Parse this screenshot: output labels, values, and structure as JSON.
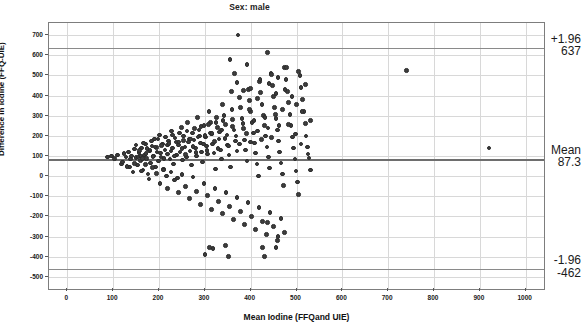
{
  "chart_data": {
    "type": "scatter",
    "title": "Sex: male",
    "xlabel": "Mean Iodine (FFQand UIE)",
    "ylabel": "Difference in iodine (FFQ-UIE)",
    "xlim": [
      -40,
      1040
    ],
    "ylim": [
      -560,
      760
    ],
    "xticks": [
      0,
      100,
      200,
      300,
      400,
      500,
      600,
      700,
      800,
      900,
      1000
    ],
    "yticks": [
      700,
      600,
      500,
      400,
      300,
      200,
      100,
      0,
      -100,
      -200,
      -300,
      -400,
      -500
    ],
    "grid": true,
    "legend": "none",
    "reference_lines": [
      {
        "name": "upper-loa",
        "value": 637,
        "label_top": "+1.96",
        "label_bottom": "637"
      },
      {
        "name": "mean-bias",
        "value": 87.3,
        "label_top": "Mean",
        "label_bottom": "87.3"
      },
      {
        "name": "lower-loa",
        "value": -462,
        "label_top": "-1.96",
        "label_bottom": "-462"
      }
    ],
    "points": [
      [
        88,
        95
      ],
      [
        96,
        100
      ],
      [
        103,
        88
      ],
      [
        110,
        105
      ],
      [
        118,
        60
      ],
      [
        124,
        112
      ],
      [
        128,
        95
      ],
      [
        133,
        120
      ],
      [
        136,
        45
      ],
      [
        140,
        100
      ],
      [
        143,
        20
      ],
      [
        147,
        135
      ],
      [
        150,
        92
      ],
      [
        153,
        55
      ],
      [
        156,
        118
      ],
      [
        159,
        78
      ],
      [
        162,
        140
      ],
      [
        165,
        30
      ],
      [
        168,
        105
      ],
      [
        170,
        160
      ],
      [
        173,
        88
      ],
      [
        176,
        10
      ],
      [
        179,
        125
      ],
      [
        182,
        65
      ],
      [
        185,
        150
      ],
      [
        188,
        100
      ],
      [
        190,
        185
      ],
      [
        193,
        45
      ],
      [
        196,
        120
      ],
      [
        199,
        75
      ],
      [
        201,
        205
      ],
      [
        204,
        95
      ],
      [
        207,
        160
      ],
      [
        210,
        35
      ],
      [
        213,
        130
      ],
      [
        216,
        0
      ],
      [
        218,
        110
      ],
      [
        221,
        175
      ],
      [
        224,
        85
      ],
      [
        227,
        225
      ],
      [
        229,
        140
      ],
      [
        232,
        60
      ],
      [
        235,
        190
      ],
      [
        238,
        105
      ],
      [
        240,
        -10
      ],
      [
        243,
        155
      ],
      [
        246,
        120
      ],
      [
        249,
        240
      ],
      [
        251,
        80
      ],
      [
        254,
        200
      ],
      [
        257,
        145
      ],
      [
        260,
        95
      ],
      [
        262,
        265
      ],
      [
        265,
        170
      ],
      [
        268,
        125
      ],
      [
        271,
        55
      ],
      [
        273,
        215
      ],
      [
        276,
        180
      ],
      [
        279,
        140
      ],
      [
        282,
        100
      ],
      [
        284,
        290
      ],
      [
        287,
        230
      ],
      [
        290,
        165
      ],
      [
        293,
        120
      ],
      [
        295,
        70
      ],
      [
        298,
        250
      ],
      [
        301,
        195
      ],
      [
        304,
        150
      ],
      [
        306,
        110
      ],
      [
        309,
        320
      ],
      [
        312,
        265
      ],
      [
        315,
        210
      ],
      [
        317,
        160
      ],
      [
        320,
        115
      ],
      [
        323,
        35
      ],
      [
        326,
        290
      ],
      [
        328,
        240
      ],
      [
        331,
        185
      ],
      [
        334,
        130
      ],
      [
        337,
        85
      ],
      [
        339,
        355
      ],
      [
        342,
        300
      ],
      [
        345,
        255
      ],
      [
        348,
        205
      ],
      [
        350,
        155
      ],
      [
        353,
        105
      ],
      [
        356,
        45
      ],
      [
        359,
        330
      ],
      [
        361,
        280
      ],
      [
        364,
        230
      ],
      [
        367,
        175
      ],
      [
        370,
        125
      ],
      [
        372,
        700
      ],
      [
        375,
        390
      ],
      [
        378,
        340
      ],
      [
        381,
        285
      ],
      [
        384,
        235
      ],
      [
        386,
        180
      ],
      [
        389,
        130
      ],
      [
        392,
        75
      ],
      [
        395,
        430
      ],
      [
        397,
        375
      ],
      [
        400,
        320
      ],
      [
        403,
        265
      ],
      [
        406,
        215
      ],
      [
        408,
        165
      ],
      [
        411,
        115
      ],
      [
        414,
        60
      ],
      [
        417,
        0
      ],
      [
        419,
        470
      ],
      [
        422,
        415
      ],
      [
        425,
        355
      ],
      [
        428,
        300
      ],
      [
        430,
        250
      ],
      [
        433,
        200
      ],
      [
        436,
        145
      ],
      [
        439,
        95
      ],
      [
        441,
        40
      ],
      [
        444,
        510
      ],
      [
        447,
        450
      ],
      [
        450,
        395
      ],
      [
        452,
        340
      ],
      [
        455,
        285
      ],
      [
        458,
        230
      ],
      [
        461,
        175
      ],
      [
        463,
        120
      ],
      [
        466,
        65
      ],
      [
        469,
        10
      ],
      [
        472,
        -45
      ],
      [
        474,
        540
      ],
      [
        477,
        480
      ],
      [
        480,
        420
      ],
      [
        483,
        365
      ],
      [
        486,
        305
      ],
      [
        488,
        250
      ],
      [
        491,
        195
      ],
      [
        494,
        140
      ],
      [
        497,
        85
      ],
      [
        499,
        25
      ],
      [
        502,
        -30
      ],
      [
        505,
        -90
      ],
      [
        508,
        500
      ],
      [
        510,
        440
      ],
      [
        513,
        380
      ],
      [
        516,
        320
      ],
      [
        519,
        260
      ],
      [
        521,
        200
      ],
      [
        524,
        145
      ],
      [
        527,
        90
      ],
      [
        530,
        30
      ],
      [
        160,
        100
      ],
      [
        164,
        88
      ],
      [
        172,
        112
      ],
      [
        180,
        130
      ],
      [
        187,
        98
      ],
      [
        195,
        142
      ],
      [
        203,
        115
      ],
      [
        211,
        88
      ],
      [
        219,
        155
      ],
      [
        226,
        125
      ],
      [
        234,
        100
      ],
      [
        242,
        170
      ],
      [
        250,
        138
      ],
      [
        258,
        108
      ],
      [
        266,
        185
      ],
      [
        274,
        148
      ],
      [
        281,
        118
      ],
      [
        289,
        200
      ],
      [
        297,
        160
      ],
      [
        305,
        128
      ],
      [
        313,
        215
      ],
      [
        321,
        172
      ],
      [
        329,
        138
      ],
      [
        336,
        230
      ],
      [
        344,
        188
      ],
      [
        352,
        150
      ],
      [
        360,
        245
      ],
      [
        368,
        200
      ],
      [
        376,
        160
      ],
      [
        383,
        260
      ],
      [
        391,
        212
      ],
      [
        399,
        170
      ],
      [
        407,
        275
      ],
      [
        415,
        225
      ],
      [
        423,
        182
      ],
      [
        431,
        290
      ],
      [
        438,
        238
      ],
      [
        446,
        192
      ],
      [
        454,
        305
      ],
      [
        462,
        250
      ],
      [
        150,
        155
      ],
      [
        158,
        128
      ],
      [
        166,
        165
      ],
      [
        174,
        138
      ],
      [
        183,
        175
      ],
      [
        191,
        145
      ],
      [
        198,
        185
      ],
      [
        206,
        152
      ],
      [
        214,
        195
      ],
      [
        222,
        162
      ],
      [
        230,
        205
      ],
      [
        237,
        170
      ],
      [
        245,
        215
      ],
      [
        253,
        178
      ],
      [
        261,
        225
      ],
      [
        269,
        185
      ],
      [
        277,
        235
      ],
      [
        285,
        195
      ],
      [
        292,
        245
      ],
      [
        300,
        202
      ],
      [
        308,
        255
      ],
      [
        316,
        212
      ],
      [
        324,
        265
      ],
      [
        332,
        220
      ],
      [
        340,
        275
      ],
      [
        120,
        70
      ],
      [
        130,
        48
      ],
      [
        138,
        85
      ],
      [
        146,
        62
      ],
      [
        154,
        95
      ],
      [
        162,
        25
      ],
      [
        170,
        58
      ],
      [
        178,
        -15
      ],
      [
        186,
        42
      ],
      [
        194,
        12
      ],
      [
        202,
        -35
      ],
      [
        210,
        30
      ],
      [
        218,
        -60
      ],
      [
        226,
        20
      ],
      [
        234,
        -20
      ],
      [
        242,
        -80
      ],
      [
        250,
        8
      ],
      [
        258,
        -50
      ],
      [
        266,
        -110
      ],
      [
        274,
        -5
      ],
      [
        282,
        -75
      ],
      [
        290,
        -140
      ],
      [
        298,
        -35
      ],
      [
        306,
        -95
      ],
      [
        314,
        -165
      ],
      [
        322,
        -60
      ],
      [
        330,
        -125
      ],
      [
        338,
        -185
      ],
      [
        346,
        -80
      ],
      [
        354,
        -150
      ],
      [
        362,
        -215
      ],
      [
        370,
        -105
      ],
      [
        378,
        -175
      ],
      [
        386,
        -240
      ],
      [
        394,
        -130
      ],
      [
        402,
        -200
      ],
      [
        410,
        -265
      ],
      [
        418,
        -155
      ],
      [
        426,
        -225
      ],
      [
        434,
        -290
      ],
      [
        442,
        -180
      ],
      [
        450,
        -250
      ],
      [
        458,
        -320
      ],
      [
        466,
        -210
      ],
      [
        474,
        -280
      ],
      [
        300,
        -390
      ],
      [
        310,
        -355
      ],
      [
        318,
        -360
      ],
      [
        345,
        -345
      ],
      [
        352,
        -400
      ],
      [
        426,
        -355
      ],
      [
        430,
        -400
      ],
      [
        437,
        -230
      ],
      [
        455,
        -355
      ],
      [
        460,
        -300
      ],
      [
        355,
        580
      ],
      [
        400,
        435
      ],
      [
        445,
        505
      ],
      [
        475,
        430
      ],
      [
        500,
        355
      ],
      [
        505,
        520
      ],
      [
        520,
        455
      ],
      [
        740,
        525
      ],
      [
        920,
        140
      ],
      [
        365,
        510
      ],
      [
        392,
        555
      ],
      [
        420,
        480
      ],
      [
        437,
        615
      ],
      [
        460,
        490
      ],
      [
        478,
        540
      ],
      [
        490,
        395
      ],
      [
        512,
        320
      ],
      [
        530,
        275
      ],
      [
        482,
        255
      ],
      [
        498,
        210
      ],
      [
        510,
        160
      ],
      [
        525,
        110
      ],
      [
        470,
        330
      ],
      [
        455,
        410
      ],
      [
        440,
        460
      ],
      [
        415,
        385
      ],
      [
        398,
        330
      ],
      [
        385,
        425
      ],
      [
        370,
        465
      ],
      [
        358,
        420
      ]
    ]
  }
}
